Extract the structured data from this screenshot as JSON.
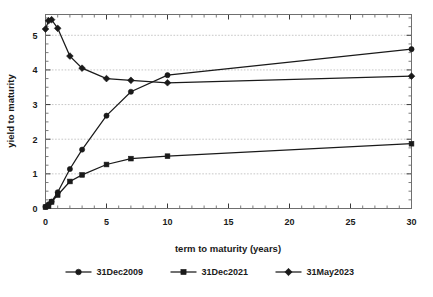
{
  "chart_data": {
    "type": "line",
    "title": "",
    "xlabel": "term to maturity (years)",
    "ylabel": "yield to maturity",
    "xlim": [
      0,
      30
    ],
    "ylim": [
      0,
      5.6
    ],
    "xticks": [
      0,
      5,
      10,
      15,
      20,
      25,
      30
    ],
    "yticks": [
      0,
      1,
      2,
      3,
      4,
      5
    ],
    "xtick_labels": [
      "0",
      "5",
      "10",
      "15",
      "20",
      "25",
      "30"
    ],
    "ytick_labels": [
      "0",
      "1",
      "2",
      "3",
      "4",
      "5"
    ],
    "x_minor_step": 1,
    "y_minor_step": 0.25,
    "grid": "horizontal-dotted",
    "legend_position": "bottom",
    "series": [
      {
        "name": "31Dec2009",
        "marker": "circle",
        "color": "#1a1a1a",
        "points": [
          {
            "x": 0,
            "y": 0.05
          },
          {
            "x": 0.25,
            "y": 0.12
          },
          {
            "x": 0.5,
            "y": 0.2
          },
          {
            "x": 1,
            "y": 0.47
          },
          {
            "x": 2,
            "y": 1.14
          },
          {
            "x": 3,
            "y": 1.7
          },
          {
            "x": 5,
            "y": 2.68
          },
          {
            "x": 7,
            "y": 3.37
          },
          {
            "x": 10,
            "y": 3.85
          },
          {
            "x": 30,
            "y": 4.6
          }
        ]
      },
      {
        "name": "31Dec2021",
        "marker": "square",
        "color": "#1a1a1a",
        "points": [
          {
            "x": 0,
            "y": 0.04
          },
          {
            "x": 0.25,
            "y": 0.07
          },
          {
            "x": 0.5,
            "y": 0.19
          },
          {
            "x": 1,
            "y": 0.39
          },
          {
            "x": 2,
            "y": 0.78
          },
          {
            "x": 3,
            "y": 0.97
          },
          {
            "x": 5,
            "y": 1.27
          },
          {
            "x": 7,
            "y": 1.44
          },
          {
            "x": 10,
            "y": 1.51
          },
          {
            "x": 30,
            "y": 1.87
          }
        ]
      },
      {
        "name": "31May2023",
        "marker": "diamond",
        "color": "#1a1a1a",
        "points": [
          {
            "x": 0,
            "y": 5.18
          },
          {
            "x": 0.25,
            "y": 5.42
          },
          {
            "x": 0.5,
            "y": 5.45
          },
          {
            "x": 1,
            "y": 5.2
          },
          {
            "x": 2,
            "y": 4.4
          },
          {
            "x": 3,
            "y": 4.05
          },
          {
            "x": 5,
            "y": 3.75
          },
          {
            "x": 7,
            "y": 3.7
          },
          {
            "x": 10,
            "y": 3.63
          },
          {
            "x": 30,
            "y": 3.82
          }
        ]
      }
    ]
  },
  "legend": {
    "items": [
      {
        "label": "31Dec2009",
        "marker": "circle"
      },
      {
        "label": "31Dec2021",
        "marker": "square"
      },
      {
        "label": "31May2023",
        "marker": "diamond"
      }
    ]
  }
}
